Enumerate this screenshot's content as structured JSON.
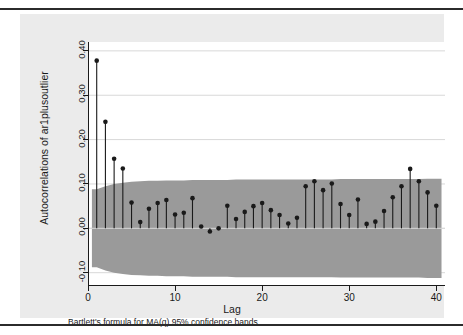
{
  "figure": {
    "background_color": "#ebebeb",
    "plot_background_color": "#ffffff",
    "band_color": "#9a9a9a",
    "stem_color": "#1a1a1a",
    "note": "Bartlett's formula for MA(q) 95% confidence bands"
  },
  "chart_data": {
    "type": "bar",
    "title": "",
    "subtitle": "",
    "xlabel": "Lag",
    "ylabel": "Autocorrelations of ar1plusoutlier",
    "annotation": "Bartlett's formula for MA(q) 95% confidence bands",
    "xlim": [
      0,
      41
    ],
    "ylim": [
      -0.13,
      0.42
    ],
    "xticks": [
      0,
      10,
      20,
      30,
      40
    ],
    "xtick_labels": [
      "0",
      "10",
      "20",
      "30",
      "40"
    ],
    "yticks": [
      -0.1,
      0.0,
      0.1,
      0.2,
      0.3,
      0.4
    ],
    "ytick_labels": [
      "-0.10",
      "0.00",
      "0.10",
      "0.20",
      "0.30",
      "0.40"
    ],
    "grid": "horizontal",
    "legend": "none",
    "categories": [
      1,
      2,
      3,
      4,
      5,
      6,
      7,
      8,
      9,
      10,
      11,
      12,
      13,
      14,
      15,
      16,
      17,
      18,
      19,
      20,
      21,
      22,
      23,
      24,
      25,
      26,
      27,
      28,
      29,
      30,
      31,
      32,
      33,
      34,
      35,
      36,
      37,
      38,
      39,
      40
    ],
    "values": [
      0.378,
      0.24,
      0.157,
      0.135,
      0.058,
      0.014,
      0.044,
      0.057,
      0.064,
      0.031,
      0.035,
      0.068,
      0.004,
      -0.007,
      0.0,
      0.051,
      0.021,
      0.037,
      0.05,
      0.057,
      0.041,
      0.03,
      0.011,
      0.024,
      0.095,
      0.106,
      0.086,
      0.101,
      0.055,
      0.03,
      0.065,
      0.01,
      0.015,
      0.039,
      0.07,
      0.095,
      0.134,
      0.106,
      0.081,
      0.051
    ],
    "confidence_band": {
      "label": "Bartlett 95% confidence band",
      "upper": [
        0.088,
        0.095,
        0.1,
        0.103,
        0.105,
        0.106,
        0.107,
        0.107,
        0.108,
        0.108,
        0.108,
        0.109,
        0.109,
        0.109,
        0.109,
        0.109,
        0.11,
        0.11,
        0.11,
        0.11,
        0.11,
        0.11,
        0.11,
        0.11,
        0.11,
        0.11,
        0.11,
        0.11,
        0.111,
        0.111,
        0.111,
        0.111,
        0.111,
        0.111,
        0.111,
        0.111,
        0.111,
        0.111,
        0.112,
        0.112
      ],
      "lower": [
        -0.088,
        -0.095,
        -0.1,
        -0.103,
        -0.105,
        -0.106,
        -0.107,
        -0.107,
        -0.108,
        -0.108,
        -0.108,
        -0.109,
        -0.109,
        -0.109,
        -0.109,
        -0.109,
        -0.11,
        -0.11,
        -0.11,
        -0.11,
        -0.11,
        -0.11,
        -0.11,
        -0.11,
        -0.11,
        -0.11,
        -0.11,
        -0.11,
        -0.111,
        -0.111,
        -0.111,
        -0.111,
        -0.111,
        -0.111,
        -0.111,
        -0.111,
        -0.111,
        -0.111,
        -0.112,
        -0.112
      ]
    }
  }
}
